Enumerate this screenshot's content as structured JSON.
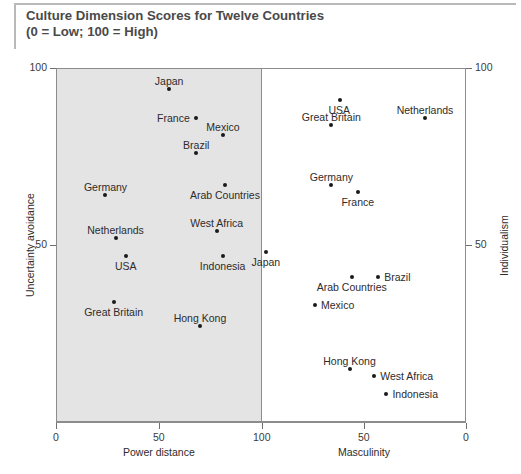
{
  "title": {
    "line1": "Culture Dimension Scores for Twelve Countries",
    "line2": "(0 = Low; 100 = High)"
  },
  "axes": {
    "left_y_title": "Uncertainty avoidance",
    "right_y_title": "Individualism",
    "left_x_title": "Power distance",
    "right_x_title": "Masculinity",
    "y_tick_top": "100",
    "y_tick_mid": "50",
    "left_x_ticks": [
      "0",
      "50",
      "100"
    ],
    "right_x_ticks": [
      "50",
      "0"
    ]
  },
  "chart_data": {
    "type": "scatter",
    "title": "Culture Dimension Scores for Twelve Countries (0 = Low; 100 = High)",
    "grid": false,
    "legend": false,
    "panels": [
      {
        "name": "left-panel",
        "xlabel": "Power distance",
        "ylabel": "Uncertainty avoidance",
        "xlim": [
          0,
          100
        ],
        "ylim": [
          0,
          100
        ],
        "x_direction": "normal",
        "background": "#e4e4e4",
        "points": [
          {
            "label": "Japan",
            "x": 55,
            "y": 94,
            "label_pos": "top"
          },
          {
            "label": "France",
            "x": 68,
            "y": 86,
            "label_pos": "left"
          },
          {
            "label": "Mexico",
            "x": 81,
            "y": 81,
            "label_pos": "top"
          },
          {
            "label": "Brazil",
            "x": 68,
            "y": 76,
            "label_pos": "top"
          },
          {
            "label": "Arab Countries",
            "x": 82,
            "y": 67,
            "label_pos": "bottom"
          },
          {
            "label": "Germany",
            "x": 24,
            "y": 64,
            "label_pos": "top"
          },
          {
            "label": "West Africa",
            "x": 78,
            "y": 54,
            "label_pos": "top"
          },
          {
            "label": "Netherlands",
            "x": 29,
            "y": 52,
            "label_pos": "top"
          },
          {
            "label": "Indonesia",
            "x": 81,
            "y": 47,
            "label_pos": "bottom"
          },
          {
            "label": "USA",
            "x": 34,
            "y": 47,
            "label_pos": "bottom"
          },
          {
            "label": "Great Britain",
            "x": 28,
            "y": 34,
            "label_pos": "bottom"
          },
          {
            "label": "Hong Kong",
            "x": 70,
            "y": 27,
            "label_pos": "top"
          }
        ]
      },
      {
        "name": "right-panel",
        "xlabel": "Masculinity",
        "ylabel": "Individualism",
        "xlim": [
          0,
          100
        ],
        "ylim": [
          0,
          100
        ],
        "x_direction": "reversed",
        "background": "#ffffff",
        "points": [
          {
            "label": "USA",
            "x": 62,
            "y": 91,
            "label_pos": "bottom"
          },
          {
            "label": "Netherlands",
            "x": 20,
            "y": 86,
            "label_pos": "top"
          },
          {
            "label": "Great Britain",
            "x": 66,
            "y": 84,
            "label_pos": "top"
          },
          {
            "label": "Germany",
            "x": 66,
            "y": 67,
            "label_pos": "top"
          },
          {
            "label": "France",
            "x": 53,
            "y": 65,
            "label_pos": "bottom"
          },
          {
            "label": "Japan",
            "x": 98,
            "y": 48,
            "label_pos": "bottom"
          },
          {
            "label": "Brazil",
            "x": 43,
            "y": 41,
            "label_pos": "right"
          },
          {
            "label": "Arab Countries",
            "x": 56,
            "y": 41,
            "label_pos": "bottom"
          },
          {
            "label": "Mexico",
            "x": 74,
            "y": 33,
            "label_pos": "right"
          },
          {
            "label": "Hong Kong",
            "x": 57,
            "y": 15,
            "label_pos": "top"
          },
          {
            "label": "West Africa",
            "x": 45,
            "y": 13,
            "label_pos": "right"
          },
          {
            "label": "Indonesia",
            "x": 39,
            "y": 8,
            "label_pos": "right"
          }
        ]
      }
    ]
  }
}
